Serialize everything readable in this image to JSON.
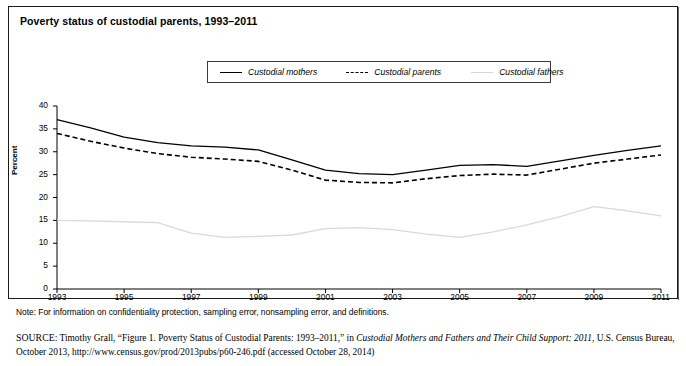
{
  "figure": {
    "title": "Poverty status of custodial parents, 1993–2011",
    "note": "Note: For information on confidentiality protection, sampling error, nonsampling error, and definitions.",
    "source_head": "SOURCE:",
    "source_part1": " Timothy Grall, “Figure 1. Poverty Status of Custodial Parents: 1993–2011,” in ",
    "source_italic": "Custodial Mothers and Fathers and Their Child Support: 2011",
    "source_part2": ", U.S. Census Bureau, October 2013, http://www.census.gov/prod/2013pubs/p60-246.pdf (accessed October 28, 2014)"
  },
  "legend": {
    "items": [
      {
        "label": "Custodial mothers",
        "style": "solid"
      },
      {
        "label": "Custodial parents",
        "style": "dashed"
      },
      {
        "label": "Custodial fathers",
        "style": "dotted"
      }
    ]
  },
  "chart_data": {
    "type": "line",
    "title": "Poverty status of custodial parents, 1993–2011",
    "xlabel": "",
    "ylabel": "Percent",
    "ylim": [
      0,
      40
    ],
    "xlim": [
      1993,
      2011
    ],
    "yticks": [
      0,
      5,
      10,
      15,
      20,
      25,
      30,
      35,
      40
    ],
    "xticks": [
      1993,
      1995,
      1997,
      1999,
      2001,
      2003,
      2005,
      2007,
      2009,
      2011
    ],
    "xtick_labels": [
      "1993",
      "1995",
      "1997",
      "1999",
      "2001",
      "2003",
      "2005",
      "2007",
      "2009",
      "2011"
    ],
    "grid": false,
    "legend_position": "top-center",
    "x": [
      1993,
      1994,
      1995,
      1996,
      1997,
      1998,
      1999,
      2000,
      2001,
      2002,
      2003,
      2004,
      2005,
      2006,
      2007,
      2008,
      2009,
      2010,
      2011
    ],
    "series": [
      {
        "name": "Custodial mothers",
        "style": "solid",
        "color": "#000000",
        "values": [
          37.0,
          35.2,
          33.2,
          32.0,
          31.3,
          31.0,
          30.4,
          28.2,
          26.0,
          25.2,
          25.0,
          26.0,
          27.0,
          27.2,
          26.8,
          28.0,
          29.2,
          30.3,
          31.3
        ]
      },
      {
        "name": "Custodial parents",
        "style": "dashed",
        "color": "#000000",
        "values": [
          34.0,
          32.3,
          30.8,
          29.6,
          28.8,
          28.4,
          27.9,
          26.0,
          23.8,
          23.3,
          23.2,
          24.1,
          24.8,
          25.1,
          24.9,
          26.2,
          27.5,
          28.4,
          29.3
        ]
      },
      {
        "name": "Custodial fathers",
        "style": "dotted",
        "color": "#d9d9d9",
        "values": [
          15.0,
          14.9,
          14.7,
          14.5,
          12.2,
          11.3,
          11.5,
          11.8,
          13.2,
          13.4,
          13.0,
          12.0,
          11.3,
          12.5,
          14.0,
          15.8,
          18.0,
          17.1,
          16.0
        ]
      }
    ]
  },
  "axis_geometry": {
    "plot_left": 57,
    "plot_right": 661,
    "plot_top": 106,
    "plot_bottom": 289
  }
}
